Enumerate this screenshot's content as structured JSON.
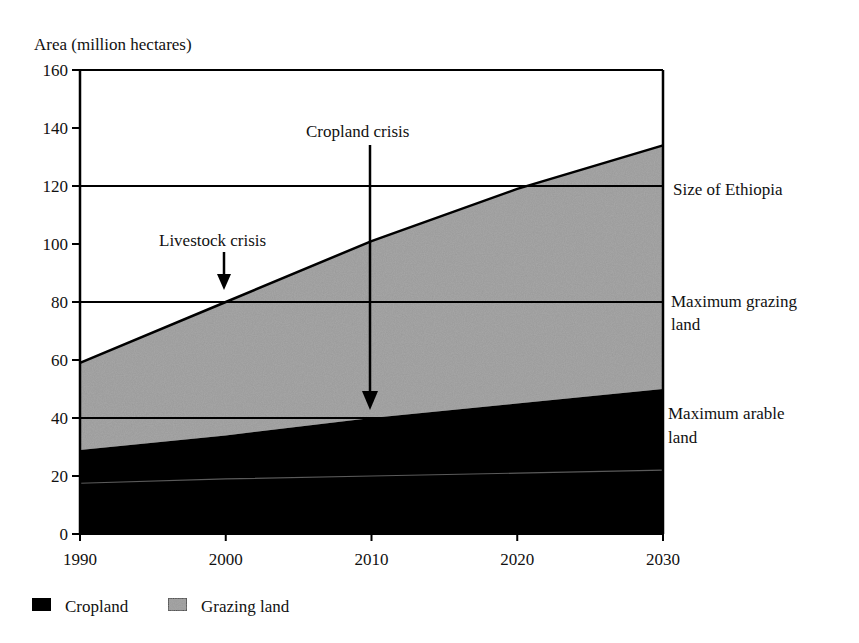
{
  "chart_data": {
    "type": "area",
    "stacked": true,
    "title": "",
    "ylabel": "Area (million hectares)",
    "xlabel": "",
    "x": [
      1990,
      2000,
      2010,
      2020,
      2030
    ],
    "xlim": [
      1990,
      2030
    ],
    "ylim": [
      0,
      160
    ],
    "x_ticks": [
      "1990",
      "2000",
      "2010",
      "2020",
      "2030"
    ],
    "y_ticks": [
      "0",
      "20",
      "40",
      "60",
      "80",
      "100",
      "120",
      "140",
      "160"
    ],
    "series": [
      {
        "name": "Cropland",
        "color": "#000000",
        "values": [
          29,
          34,
          40,
          45,
          50
        ]
      },
      {
        "name": "Grazing land",
        "color": "#9a9a9a",
        "values": [
          30,
          46,
          61,
          74,
          84
        ]
      }
    ],
    "totals": [
      59,
      80,
      101,
      119,
      134
    ],
    "inner_line": {
      "description": "faint line inside cropland",
      "values": [
        17.5,
        19,
        20,
        21,
        22
      ]
    },
    "reference_lines": [
      {
        "label": "Size of Ethiopia",
        "y": 120
      },
      {
        "label": "Maximum grazing land",
        "label_lines": [
          "Maximum grazing",
          "land"
        ],
        "y": 80
      },
      {
        "label": "Maximum arable land",
        "label_lines": [
          "Maximum arable",
          "land"
        ],
        "y": 40
      }
    ],
    "annotations": [
      {
        "label": "Livestock crisis",
        "x": 2000,
        "y": 80
      },
      {
        "label": "Cropland crisis",
        "x": 2010,
        "y": 40
      }
    ],
    "legend": {
      "position": "bottom-left",
      "entries": [
        {
          "label": "Cropland",
          "swatch": "#000000"
        },
        {
          "label": "Grazing land",
          "swatch": "#9a9a9a"
        }
      ]
    },
    "grid": false
  },
  "labels": {
    "ylabel": "Area (million hectares)",
    "ref_ethiopia": "Size of Ethiopia",
    "ref_grazing_1": "Maximum grazing",
    "ref_grazing_2": "land",
    "ref_arable_1": "Maximum arable",
    "ref_arable_2": "land",
    "livestock": "Livestock crisis",
    "cropland_crisis": "Cropland crisis",
    "legend_cropland": "Cropland",
    "legend_grazing": "Grazing land"
  }
}
